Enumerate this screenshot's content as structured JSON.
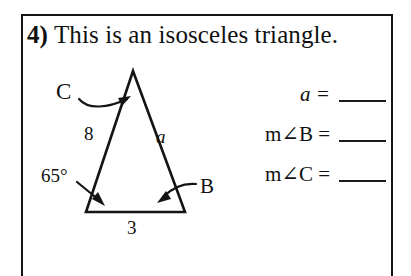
{
  "worksheet": {
    "problem_number": "4)",
    "problem_text": "This is an isosceles triangle."
  },
  "figure": {
    "shape": "isosceles-triangle",
    "vertex_c_label": "C",
    "vertex_b_label": "B",
    "left_side_label": "8",
    "right_side_label": "a",
    "base_label": "3",
    "angle_label": "65°",
    "arrow_to_c": "curved-arrow",
    "arrow_to_angle": "straight-arrow",
    "arrow_to_b": "curved-arrow"
  },
  "answers": [
    {
      "prompt_var": "a",
      "prompt_suffix": " =",
      "prompt_prefix": "",
      "value": ""
    },
    {
      "prompt_var": "",
      "prompt_prefix": "m∠B",
      "prompt_suffix": " =",
      "value": ""
    },
    {
      "prompt_var": "",
      "prompt_prefix": "m∠C",
      "prompt_suffix": " =",
      "value": ""
    }
  ],
  "answer_labels": {
    "row0": "a =",
    "row1": "m∠B =",
    "row2": "m∠C ="
  },
  "colors": {
    "ink": "#111111",
    "frame": "#151515",
    "paper": "#ffffff"
  }
}
